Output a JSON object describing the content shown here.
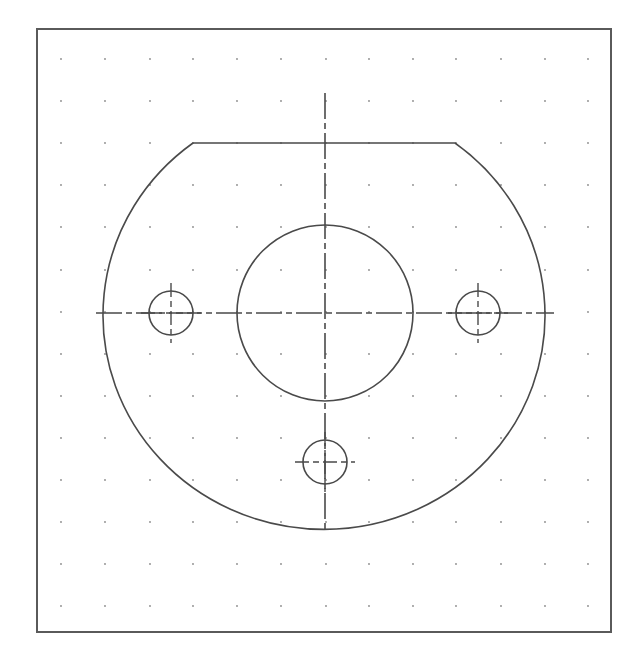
{
  "drawing": {
    "title": "Flange plate with center bore and three bolt holes",
    "frame": {
      "x": 37,
      "y": 29,
      "width": 574,
      "height": 603,
      "stroke": "#5a5a5a",
      "stroke_width": 2
    },
    "grid": {
      "dot_color": "#8a8a8a",
      "dot_radius": 0.9,
      "columns_x": [
        61,
        105,
        150,
        193,
        237,
        281,
        326,
        369,
        413,
        456,
        501,
        545,
        588
      ],
      "rows_y": [
        59,
        101,
        143,
        185,
        227,
        270,
        312,
        354,
        396,
        438,
        480,
        522,
        564,
        606
      ]
    },
    "line_color": "#4a4a4a",
    "outer_profile": {
      "center": [
        325,
        313
      ],
      "rx": 221,
      "ry": 214,
      "chord_y": 143,
      "chord_x_start": 193,
      "chord_x_end": 455
    },
    "center_bore": {
      "cx": 325,
      "cy": 313,
      "r": 88
    },
    "bolt_holes": [
      {
        "name": "left",
        "cx": 171,
        "cy": 313,
        "r": 22
      },
      {
        "name": "right",
        "cx": 478,
        "cy": 313,
        "r": 22
      },
      {
        "name": "bottom",
        "cx": 325,
        "cy": 462,
        "r": 22
      }
    ],
    "centerlines": {
      "horizontal": {
        "x1": 96,
        "x2": 554,
        "y": 313
      },
      "vertical": {
        "x": 325,
        "y1": 93,
        "y2": 533
      },
      "dash": "26 4 6 4"
    },
    "hole_crosshair_extent": 30
  }
}
